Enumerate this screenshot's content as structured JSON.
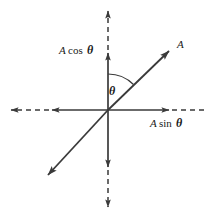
{
  "figure": {
    "name": "vector-components-diagram",
    "background_color": "#ffffff",
    "line_color": "#3a3a3a",
    "text_color": "#1a1a1a"
  },
  "labels": {
    "vector": "A",
    "vertical_component": "A cos θ",
    "horizontal_component": "A sin θ",
    "angle": "θ"
  },
  "label_parts": {
    "vector_symbol": "A",
    "cos_amplitude": "A",
    "cos_function": "cos",
    "sin_amplitude": "A",
    "sin_function": "sin",
    "theta_symbol": "θ"
  },
  "geometry": {
    "origin": {
      "x": 108,
      "y": 110
    },
    "vertical_axis": {
      "solid_top_y": 50,
      "solid_bottom_y": 170,
      "dashed_top_y": 8,
      "dashed_bottom_y": 210
    },
    "horizontal_axis": {
      "solid_left_x": 49,
      "solid_right_x": 172,
      "dashed_left_x": 8,
      "dashed_right_x": 208
    },
    "vector": {
      "tip": {
        "x": 172,
        "y": 48
      },
      "tail": {
        "x": 45,
        "y": 178
      }
    },
    "angle_arc_radius": 36,
    "angle_degrees": 45
  }
}
